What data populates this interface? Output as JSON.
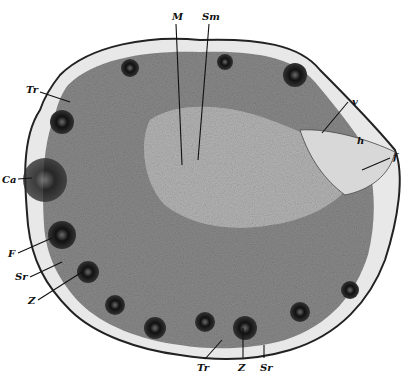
{
  "figure": {
    "labels": [
      {
        "id": "M",
        "text": "M",
        "x": 172,
        "y": 12
      },
      {
        "id": "Sm",
        "text": "Sm",
        "x": 202,
        "y": 12
      },
      {
        "id": "Tr_top",
        "text": "Tr",
        "x": 26,
        "y": 85
      },
      {
        "id": "v",
        "text": "v",
        "x": 352,
        "y": 97
      },
      {
        "id": "h",
        "text": "h",
        "x": 357,
        "y": 136
      },
      {
        "id": "f",
        "text": "f",
        "x": 393,
        "y": 152
      },
      {
        "id": "Ca",
        "text": "Ca",
        "x": 2,
        "y": 175
      },
      {
        "id": "F",
        "text": "F",
        "x": 8,
        "y": 249
      },
      {
        "id": "Sr_left",
        "text": "Sr",
        "x": 15,
        "y": 272
      },
      {
        "id": "Z_left",
        "text": "Z",
        "x": 28,
        "y": 296
      },
      {
        "id": "Tr_bottom",
        "text": "Tr",
        "x": 197,
        "y": 363
      },
      {
        "id": "Z_bottom",
        "text": "Z",
        "x": 238,
        "y": 363
      },
      {
        "id": "Sr_bottom",
        "text": "Sr",
        "x": 260,
        "y": 363
      }
    ]
  }
}
